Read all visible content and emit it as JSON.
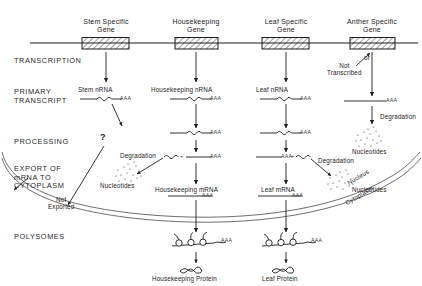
{
  "diagram": {
    "stages": [
      {
        "id": "transcription",
        "label": "TRANSCRIPTION",
        "x": 14,
        "y": 57
      },
      {
        "id": "primary-transcript",
        "label": "PRIMARY\nTRANSCRIPT",
        "x": 14,
        "y": 88
      },
      {
        "id": "processing",
        "label": "PROCESSING",
        "x": 14,
        "y": 138
      },
      {
        "id": "export",
        "label": "EXPORT OF\nmRNA TO\nCYTOPLASM",
        "x": 14,
        "y": 165
      },
      {
        "id": "polysomes",
        "label": "POLYSOMES",
        "x": 14,
        "y": 233
      }
    ],
    "columns": [
      {
        "id": "stem",
        "gene": "Stem Specific\nGene",
        "nrna": "Stem nRNA",
        "mrna": null,
        "protein": null,
        "cx": 106
      },
      {
        "id": "housekeeping",
        "gene": "Housekeeping\nGene",
        "nrna": "Housekeeping nRNA",
        "mrna": "Housekeeping mRNA",
        "protein": "Housekeeping Protein",
        "cx": 196
      },
      {
        "id": "leaf",
        "gene": "Leaf Specific\nGene",
        "nrna": "Leaf nRNA",
        "mrna": "Leaf mRNA",
        "protein": "Leaf Protein",
        "cx": 286
      },
      {
        "id": "anther",
        "gene": "Anther Specific\nGene",
        "nrna": null,
        "mrna": null,
        "protein": null,
        "cx": 372
      }
    ],
    "annotations": {
      "or": "or",
      "not_transcribed": "Not\nTranscribed",
      "not_exported": "Not\nExported",
      "question": "?",
      "degradation": "Degradation",
      "nucleotides": "Nucleotides",
      "poly_a": "AAA",
      "plus": "+",
      "nucleus": "Nucleus",
      "cytoplasm": "Cytoplasm"
    },
    "colors": {
      "ink": "#1d1d1d",
      "envelope": "#555555",
      "paper": "#ffffff"
    }
  }
}
